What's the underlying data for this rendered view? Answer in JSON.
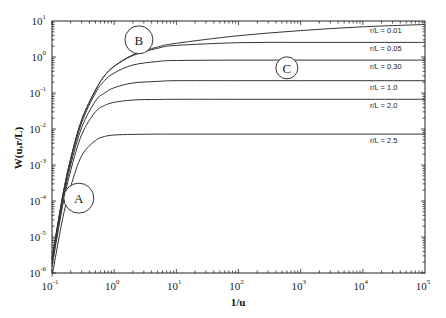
{
  "chart_data": {
    "type": "line",
    "title": "",
    "xlabel": "1/u",
    "ylabel": "W(u,r/L)",
    "xscale": "log",
    "yscale": "log",
    "xlim": [
      0.1,
      100000
    ],
    "ylim": [
      1e-06,
      10
    ],
    "grid": false,
    "legend_position": "inline-right",
    "x_ticks": [
      {
        "base": "10",
        "exp": "-1"
      },
      {
        "base": "10",
        "exp": "0"
      },
      {
        "base": "10",
        "exp": "1"
      },
      {
        "base": "10",
        "exp": "2"
      },
      {
        "base": "10",
        "exp": "3"
      },
      {
        "base": "10",
        "exp": "4"
      },
      {
        "base": "10",
        "exp": "5"
      }
    ],
    "y_ticks": [
      {
        "base": "10",
        "exp": "1"
      },
      {
        "base": "10",
        "exp": "0"
      },
      {
        "base": "10",
        "exp": "-1"
      },
      {
        "base": "10",
        "exp": "-2"
      },
      {
        "base": "10",
        "exp": "-3"
      },
      {
        "base": "10",
        "exp": "-4"
      },
      {
        "base": "10",
        "exp": "-5"
      },
      {
        "base": "10",
        "exp": "-6"
      }
    ],
    "x": [
      0.1,
      0.15,
      0.2,
      0.3,
      0.5,
      0.7,
      1,
      2,
      5,
      10,
      100,
      1000,
      10000,
      100000
    ],
    "series": [
      {
        "name": "r/L = 0.01",
        "label": "r/L = 0.01",
        "values": [
          2.5e-06,
          0.00015,
          0.0015,
          0.018,
          0.12,
          0.3,
          0.55,
          1.15,
          1.9,
          2.4,
          3.9,
          5.4,
          6.9,
          8.0
        ]
      },
      {
        "name": "r/L = 0.05",
        "label": "r/L = 0.05",
        "values": [
          2.5e-06,
          0.00015,
          0.0015,
          0.018,
          0.12,
          0.3,
          0.55,
          1.1,
          1.75,
          2.1,
          2.5,
          2.55,
          2.55,
          2.55
        ]
      },
      {
        "name": "r/L = 0.30",
        "label": "r/L = 0.30",
        "values": [
          2.2e-06,
          0.00013,
          0.0013,
          0.015,
          0.1,
          0.22,
          0.36,
          0.6,
          0.75,
          0.8,
          0.82,
          0.82,
          0.82,
          0.82
        ]
      },
      {
        "name": "r/L = 1.0",
        "label": "r/L = 1.0",
        "values": [
          1.8e-06,
          0.0001,
          0.001,
          0.011,
          0.06,
          0.1,
          0.14,
          0.19,
          0.21,
          0.22,
          0.22,
          0.22,
          0.22,
          0.22
        ]
      },
      {
        "name": "r/L = 2.0",
        "label": "r/L = 2.0",
        "values": [
          1.5e-06,
          8e-05,
          0.0007,
          0.007,
          0.03,
          0.045,
          0.055,
          0.064,
          0.066,
          0.067,
          0.067,
          0.067,
          0.067,
          0.067
        ]
      },
      {
        "name": "r/L = 2.5",
        "label": "r/L = 2.5",
        "values": [
          8e-07,
          3.5e-05,
          0.00025,
          0.0018,
          0.0048,
          0.0062,
          0.0068,
          0.0071,
          0.0072,
          0.0072,
          0.0072,
          0.0072,
          0.0072,
          0.0072
        ]
      }
    ],
    "annotations": [
      {
        "text": "A",
        "x": 0.27,
        "y": 0.00012,
        "shape": "circle"
      },
      {
        "text": "B",
        "x": 2.5,
        "y": 3.0,
        "shape": "circle"
      },
      {
        "text": "C",
        "x": 600,
        "y": 0.5,
        "shape": "circle"
      }
    ]
  },
  "colors": {
    "line": "#333333",
    "axis": "#222222",
    "background": "#ffffff"
  }
}
